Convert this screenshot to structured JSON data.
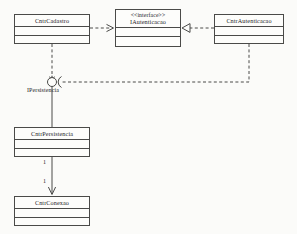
{
  "diagram": {
    "kind": "class-diagram",
    "background_color": "#fbfbf9",
    "line_color": "#4a4a48",
    "text_color": "#26262a"
  },
  "classes": [
    {
      "id": "cntr-cadastro",
      "name": "CntrCadastro",
      "stereotype": "",
      "x": 14,
      "y": 14,
      "width": 76,
      "height": 30,
      "compartments": 2
    },
    {
      "id": "iautenticacao",
      "name": "IAutenticacao",
      "stereotype": "<<interface>>",
      "x": 115,
      "y": 9,
      "width": 66,
      "height": 38,
      "compartments": 2
    },
    {
      "id": "cntr-autenticacao",
      "name": "CntrAutenticacao",
      "stereotype": "",
      "x": 214,
      "y": 14,
      "width": 70,
      "height": 30,
      "compartments": 2
    },
    {
      "id": "cntr-persistencia",
      "name": "CntrPersistencia",
      "stereotype": "",
      "x": 14,
      "y": 127,
      "width": 76,
      "height": 30,
      "compartments": 2
    },
    {
      "id": "cntr-conexao",
      "name": "CntrConexao",
      "stereotype": "",
      "x": 14,
      "y": 196,
      "width": 76,
      "height": 30,
      "compartments": 2
    }
  ],
  "interfaces": {
    "persistencia": {
      "label": "IPersistencia",
      "label_x": 27,
      "label_y": 87,
      "ball_x": 52,
      "ball_y": 82,
      "ball_r": 4.5
    }
  },
  "relationships": [
    {
      "id": "dep-cadastro-iautenticacao",
      "type": "dependency",
      "style": "dashed",
      "arrow": "open",
      "from": "cntr-cadastro",
      "to": "iautenticacao"
    },
    {
      "id": "real-autenticacao-iautenticacao",
      "type": "realization",
      "style": "dashed",
      "arrow": "hollow-triangle",
      "from": "cntr-autenticacao",
      "to": "iautenticacao"
    },
    {
      "id": "provide-cadastro-ipersistencia",
      "type": "provided-interface",
      "style": "solid",
      "arrow": "none",
      "from": "cntr-cadastro",
      "to": "IPersistencia"
    },
    {
      "id": "require-autenticacao-ipersistencia",
      "type": "required-interface",
      "style": "dashed",
      "arrow": "socket",
      "from": "cntr-autenticacao",
      "to": "IPersistencia"
    },
    {
      "id": "realize-persistencia-ipersistencia",
      "type": "provided-interface-link",
      "style": "solid",
      "arrow": "none",
      "from": "cntr-persistencia",
      "to": "IPersistencia"
    },
    {
      "id": "assoc-persistencia-conexao",
      "type": "association",
      "style": "solid",
      "arrow": "open",
      "from": "cntr-persistencia",
      "to": "cntr-conexao",
      "source_multiplicity": "1",
      "target_multiplicity": "1"
    }
  ],
  "multiplicities": [
    {
      "id": "mult-source",
      "value": "1",
      "x": 43,
      "y": 159
    },
    {
      "id": "mult-target",
      "value": "1",
      "x": 43,
      "y": 178
    }
  ]
}
